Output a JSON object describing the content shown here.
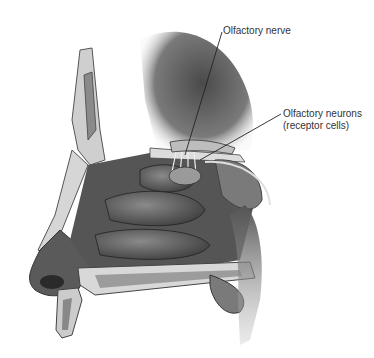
{
  "figure": {
    "style": "grayscale anatomical illustration",
    "colors": {
      "background": "#ffffff",
      "tissue_dark": "#3a3a3a",
      "tissue_mid": "#6e6e6e",
      "tissue_light": "#a8a8a8",
      "bone": "#d9d9d9",
      "label_text": "#333333",
      "leader_line": "#222222"
    }
  },
  "labels": [
    {
      "id": "olfactory-nerve",
      "text": "Olfactory nerve"
    },
    {
      "id": "olfactory-neurons",
      "line1": "Olfactory neurons",
      "line2": "(receptor cells)"
    }
  ]
}
